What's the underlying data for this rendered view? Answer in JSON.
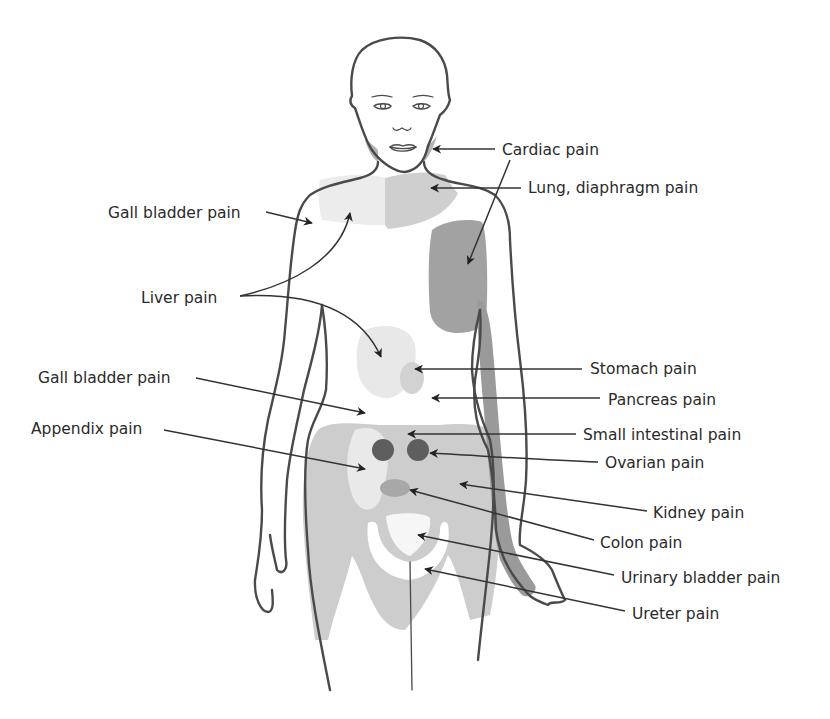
{
  "diagram": {
    "colors": {
      "light": "#ececec",
      "mid": "#d2d2d2",
      "hip": "#cdcdcd",
      "dark": "#a5a5a5",
      "darker": "#8e8e8e",
      "ovary": "#5e5e5e",
      "outline": "#4a4a4a"
    },
    "labels": [
      {
        "id": "cardiac",
        "text": "Cardiac pain"
      },
      {
        "id": "lung",
        "text": "Lung, diaphragm pain"
      },
      {
        "id": "gall-upper",
        "text": "Gall bladder pain"
      },
      {
        "id": "liver",
        "text": "Liver pain"
      },
      {
        "id": "stomach",
        "text": "Stomach pain"
      },
      {
        "id": "pancreas",
        "text": "Pancreas pain"
      },
      {
        "id": "gall-lower",
        "text": "Gall bladder pain"
      },
      {
        "id": "small-intestine",
        "text": "Small intestinal pain"
      },
      {
        "id": "appendix",
        "text": "Appendix pain"
      },
      {
        "id": "ovarian",
        "text": "Ovarian pain"
      },
      {
        "id": "kidney",
        "text": "Kidney pain"
      },
      {
        "id": "colon",
        "text": "Colon pain"
      },
      {
        "id": "urinary-bladder",
        "text": "Urinary bladder pain"
      },
      {
        "id": "ureter",
        "text": "Ureter pain"
      }
    ]
  }
}
